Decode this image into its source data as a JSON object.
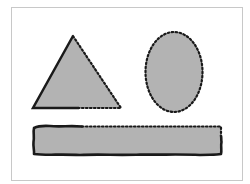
{
  "diagram": {
    "fill_color": "#b3b3b3",
    "stroke_color": "#1a1a1a",
    "frame_color": "#c8c8c8",
    "shapes": [
      {
        "type": "triangle",
        "description": "triangle with solid left edge and left half of base, dotted right edge and right half of base"
      },
      {
        "type": "ellipse",
        "description": "ellipse with fully dotted outline"
      },
      {
        "type": "rectangle",
        "description": "rectangle with rough solid outline on left, bottom and right; dotted top-right portion"
      }
    ]
  }
}
